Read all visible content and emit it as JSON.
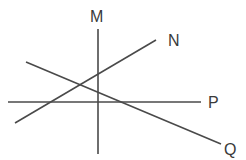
{
  "diagram": {
    "type": "intersecting-lines",
    "lines": [
      {
        "id": "M",
        "label": "M",
        "x1": 98,
        "y1": 29,
        "x2": 98,
        "y2": 154,
        "label_x": 90,
        "label_y": 22
      },
      {
        "id": "N",
        "label": "N",
        "x1": 15,
        "y1": 123,
        "x2": 156,
        "y2": 40,
        "label_x": 168,
        "label_y": 46
      },
      {
        "id": "P",
        "label": "P",
        "x1": 8,
        "y1": 102,
        "x2": 201,
        "y2": 102,
        "label_x": 208,
        "label_y": 108
      },
      {
        "id": "Q",
        "label": "Q",
        "x1": 26,
        "y1": 62,
        "x2": 221,
        "y2": 144,
        "label_x": 224,
        "label_y": 155
      }
    ]
  }
}
